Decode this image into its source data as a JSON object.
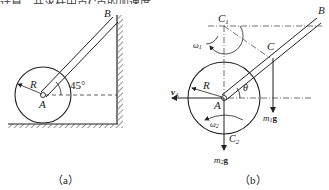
{
  "top_text": "计算，并求杆中点C点的加速度",
  "figure_a": {
    "caption": "（a）",
    "labels": {
      "B": "B",
      "R": "R",
      "A": "A",
      "angle": "45°"
    }
  },
  "figure_b": {
    "caption": "（b）",
    "labels": {
      "B": "B",
      "C": "C",
      "C1": "C",
      "C1_sub": "1",
      "C2": "C",
      "C2_sub": "2",
      "omega1": "ω",
      "omega1_sub": "1",
      "omega2": "ω",
      "omega2_sub": "2",
      "vA": "v",
      "vA_sub": "A",
      "R": "R",
      "A": "A",
      "theta": "θ",
      "m1g": "m",
      "m1g_sub": "1",
      "m1g_g": "g",
      "m2g": "m",
      "m2g_sub": "2",
      "m2g_g": "g"
    }
  }
}
